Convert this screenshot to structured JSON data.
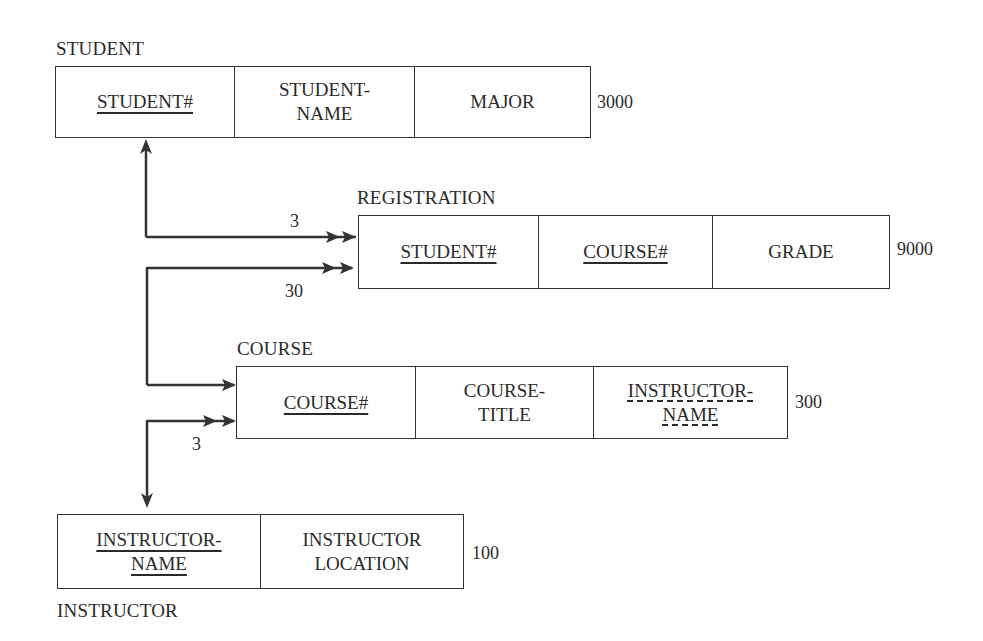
{
  "diagram": {
    "tables": {
      "student": {
        "name": "STUDENT",
        "count": "3000",
        "columns": [
          {
            "line1": "STUDENT#",
            "line2": "",
            "key": "primary"
          },
          {
            "line1": "STUDENT-",
            "line2": "NAME",
            "key": "none"
          },
          {
            "line1": "MAJOR",
            "line2": "",
            "key": "none"
          }
        ]
      },
      "registration": {
        "name": "REGISTRATION",
        "count": "9000",
        "columns": [
          {
            "line1": "STUDENT#",
            "line2": "",
            "key": "primary"
          },
          {
            "line1": "COURSE#",
            "line2": "",
            "key": "primary"
          },
          {
            "line1": "GRADE",
            "line2": "",
            "key": "none"
          }
        ]
      },
      "course": {
        "name": "COURSE",
        "count": "300",
        "columns": [
          {
            "line1": "COURSE#",
            "line2": "",
            "key": "primary"
          },
          {
            "line1": "COURSE-",
            "line2": "TITLE",
            "key": "none"
          },
          {
            "line1": "INSTRUCTOR-",
            "line2": "NAME",
            "key": "foreign"
          }
        ]
      },
      "instructor": {
        "name": "INSTRUCTOR",
        "count": "100",
        "columns": [
          {
            "line1": "INSTRUCTOR-",
            "line2": "NAME",
            "key": "primary"
          },
          {
            "line1": "INSTRUCTOR",
            "line2": "LOCATION",
            "key": "none"
          }
        ]
      }
    },
    "relationships": [
      {
        "from": "STUDENT",
        "to": "REGISTRATION",
        "cardinality": "3"
      },
      {
        "from": "COURSE",
        "to": "REGISTRATION",
        "cardinality": "30"
      },
      {
        "from": "INSTRUCTOR",
        "to": "COURSE",
        "cardinality": "3"
      }
    ],
    "colors": {
      "line": "#333333",
      "text": "#2a2a2a",
      "background": "#ffffff"
    }
  }
}
